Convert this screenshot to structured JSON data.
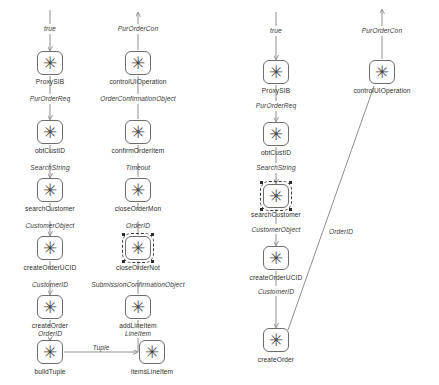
{
  "diagram": {
    "icon_glyph": "✳",
    "node_icon_name": "asterisk-node-icon",
    "colors": {
      "node_stroke": "#6d6d6d",
      "node_fill": "#fdfdfd",
      "edge": "#8a8a8a",
      "text": "#2e2e2e",
      "selection": "#3b3b3b"
    },
    "columns": [
      {
        "id": "column-1",
        "nodes": [
          {
            "id": "c1-n1",
            "label": "ProxySIB",
            "x": 50,
            "y": 63,
            "selected": false
          },
          {
            "id": "c1-n2",
            "label": "obtCustID",
            "x": 50,
            "y": 132,
            "selected": false
          },
          {
            "id": "c1-n3",
            "label": "searchCustomer",
            "x": 50,
            "y": 190,
            "selected": false
          },
          {
            "id": "c1-n4",
            "label": "createOrderUCID",
            "x": 50,
            "y": 248,
            "selected": false
          },
          {
            "id": "c1-n5",
            "label": "createOrder",
            "x": 50,
            "y": 307,
            "selected": false
          },
          {
            "id": "c1-n6",
            "label": "buildTuple",
            "x": 50,
            "y": 352,
            "selected": false
          },
          {
            "id": "c1-n7",
            "label": "itemsLineItem",
            "x": 152,
            "y": 352,
            "selected": false
          }
        ],
        "edge_labels": [
          {
            "text": "true",
            "x": 50,
            "y": 29,
            "italic": true
          },
          {
            "text": "PurOrderReq",
            "x": 50,
            "y": 99,
            "italic": true
          },
          {
            "text": "SearchString",
            "x": 50,
            "y": 158,
            "italic": true
          },
          {
            "text": "CustomerObject",
            "x": 50,
            "y": 216,
            "italic": true
          },
          {
            "text": "CustomerID",
            "x": 50,
            "y": 275,
            "italic": true
          },
          {
            "text": "OrderID",
            "x": 50,
            "y": 333,
            "italic": true
          },
          {
            "text": "Tuple",
            "x": 101,
            "y": 349,
            "italic": true
          }
        ]
      },
      {
        "id": "column-2",
        "nodes": [
          {
            "id": "c2-n1",
            "label": "controlUIOperation",
            "x": 138,
            "y": 63,
            "selected": false
          },
          {
            "id": "c2-n2",
            "label": "confirmOrderItem",
            "x": 138,
            "y": 132,
            "selected": false
          },
          {
            "id": "c2-n3",
            "label": "closeOrderMon",
            "x": 138,
            "y": 190,
            "selected": false
          },
          {
            "id": "c2-n4",
            "label": "closeOrderNot",
            "x": 138,
            "y": 248,
            "selected": true
          },
          {
            "id": "c2-n5",
            "label": "addLineItem",
            "x": 138,
            "y": 307,
            "selected": false
          }
        ],
        "edge_labels": [
          {
            "text": "PurOrderCon",
            "x": 138,
            "y": 29,
            "italic": true
          },
          {
            "text": "OrderConfirmationObject",
            "x": 138,
            "y": 99,
            "italic": true
          },
          {
            "text": "Timeout",
            "x": 138,
            "y": 158,
            "italic": true
          },
          {
            "text": "OrderID",
            "x": 138,
            "y": 216,
            "italic": true
          },
          {
            "text": "SubmissionConfirmationObject",
            "x": 138,
            "y": 275,
            "italic": true
          },
          {
            "text": "LineItem",
            "x": 138,
            "y": 333,
            "italic": true
          }
        ]
      },
      {
        "id": "column-3",
        "nodes": [
          {
            "id": "c3-n1",
            "label": "ProxySIB",
            "x": 276,
            "y": 72,
            "selected": false
          },
          {
            "id": "c3-n2",
            "label": "obtCustID",
            "x": 276,
            "y": 134,
            "selected": false
          },
          {
            "id": "c3-n3",
            "label": "searchCustomer",
            "x": 276,
            "y": 196,
            "selected": true
          },
          {
            "id": "c3-n4",
            "label": "createOrderUCID",
            "x": 276,
            "y": 258,
            "selected": false
          },
          {
            "id": "c3-n5",
            "label": "createOrder",
            "x": 276,
            "y": 340,
            "selected": false
          },
          {
            "id": "c3-n6",
            "label": "controlUIOperation",
            "x": 382,
            "y": 72,
            "selected": false
          }
        ],
        "edge_labels": [
          {
            "text": "true",
            "x": 276,
            "y": 31,
            "italic": true
          },
          {
            "text": "PurOrderReq",
            "x": 276,
            "y": 106,
            "italic": true
          },
          {
            "text": "SearchString",
            "x": 276,
            "y": 168,
            "italic": true
          },
          {
            "text": "CustomerObject",
            "x": 276,
            "y": 229,
            "italic": true
          },
          {
            "text": "CustomerID",
            "x": 276,
            "y": 291,
            "italic": true
          },
          {
            "text": "PurOrderCon",
            "x": 382,
            "y": 31,
            "italic": true
          },
          {
            "text": "OrderID",
            "x": 341,
            "y": 232,
            "italic": true
          }
        ]
      }
    ]
  }
}
